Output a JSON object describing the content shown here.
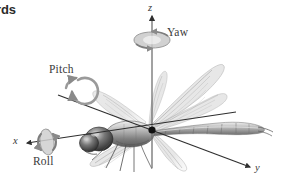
{
  "figure": {
    "title_fragment": "rds",
    "background_color": "#ffffff",
    "width": 302,
    "height": 191
  },
  "axes": {
    "origin": {
      "x": 152,
      "y": 130
    },
    "items": [
      {
        "name": "z-axis",
        "label": "z",
        "direction": "up",
        "color": "#555555",
        "from": {
          "x": 152,
          "y": 168
        },
        "to": {
          "x": 152,
          "y": 14
        }
      },
      {
        "name": "x-axis",
        "label": "x",
        "direction": "left",
        "color": "#333333",
        "from": {
          "x": 232,
          "y": 112
        },
        "to": {
          "x": 26,
          "y": 143
        }
      },
      {
        "name": "y-axis",
        "label": "y",
        "direction": "lower-right",
        "color": "#333333",
        "from": {
          "x": 60,
          "y": 96
        },
        "to": {
          "x": 251,
          "y": 168
        }
      }
    ]
  },
  "rotations": [
    {
      "name": "yaw",
      "label": "Yaw",
      "about_axis": "z",
      "color": "#8a8a8a"
    },
    {
      "name": "pitch",
      "label": "Pitch",
      "about_axis": "y",
      "color": "#8a8a8a"
    },
    {
      "name": "roll",
      "label": "Roll",
      "about_axis": "x",
      "color": "#8a8a8a"
    }
  ],
  "colors": {
    "background": "#ffffff",
    "axis_line": "#333333",
    "rotation_arrow": "#8a8a8a",
    "label_text": "#3a3a3a",
    "body_dark": "#4a4a4a",
    "body_mid": "#8d8d8d",
    "body_light": "#c8c8c8",
    "wing": "#b9b9b9",
    "origin_dot": "#111111"
  }
}
